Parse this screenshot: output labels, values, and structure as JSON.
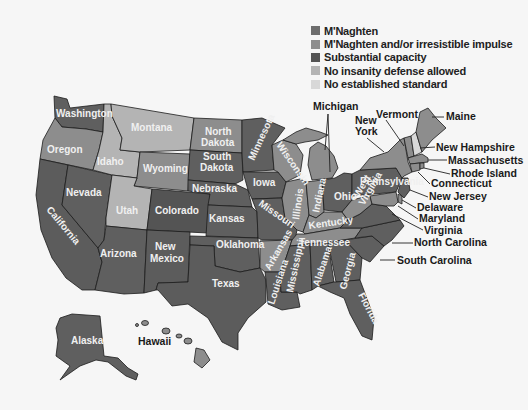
{
  "legend": {
    "items": [
      {
        "label": "M'Naghten",
        "color": "#6d6d6d",
        "key": "mn"
      },
      {
        "label": "M'Naghten and/or irresistible impulse",
        "color": "#8d8d8d",
        "key": "ii"
      },
      {
        "label": "Substantial capacity",
        "color": "#545454",
        "key": "sc"
      },
      {
        "label": "No insanity defense allowed",
        "color": "#b4b4b4",
        "key": "no"
      },
      {
        "label": "No established standard",
        "color": "#d8d8d8",
        "key": "ne"
      }
    ]
  },
  "states": {
    "washington": {
      "label": "Washington",
      "standard": "M'Naghten"
    },
    "oregon": {
      "label": "Oregon",
      "standard": "M'Naghten and/or irresistible impulse"
    },
    "california": {
      "label": "California",
      "standard": "M'Naghten"
    },
    "nevada": {
      "label": "Nevada",
      "standard": "M'Naghten"
    },
    "idaho": {
      "label": "Idaho",
      "standard": "No insanity defense allowed"
    },
    "montana": {
      "label": "Montana",
      "standard": "No insanity defense allowed"
    },
    "wyoming": {
      "label": "Wyoming",
      "standard": "M'Naghten and/or irresistible impulse"
    },
    "utah": {
      "label": "Utah",
      "standard": "No insanity defense allowed"
    },
    "colorado": {
      "label": "Colorado",
      "standard": "Substantial capacity"
    },
    "arizona": {
      "label": "Arizona",
      "standard": "M'Naghten"
    },
    "new_mexico": {
      "label": "New Mexico",
      "standard": "M'Naghten and/or irresistible impulse"
    },
    "north_dakota": {
      "label": "North Dakota",
      "standard": "M'Naghten and/or irresistible impulse"
    },
    "south_dakota": {
      "label": "South Dakota",
      "standard": "M'Naghten"
    },
    "nebraska": {
      "label": "Nebraska",
      "standard": "M'Naghten"
    },
    "kansas": {
      "label": "Kansas",
      "standard": "M'Naghten"
    },
    "oklahoma": {
      "label": "Oklahoma",
      "standard": "M'Naghten"
    },
    "texas": {
      "label": "Texas",
      "standard": "M'Naghten"
    },
    "minnesota": {
      "label": "Minnesota",
      "standard": "M'Naghten"
    },
    "iowa": {
      "label": "Iowa",
      "standard": "M'Naghten"
    },
    "missouri": {
      "label": "Missouri",
      "standard": "M'Naghten"
    },
    "arkansas": {
      "label": "Arkansas",
      "standard": "M'Naghten and/or irresistible impulse"
    },
    "louisiana": {
      "label": "Louisiana",
      "standard": "M'Naghten"
    },
    "wisconsin": {
      "label": "Wisconsin",
      "standard": "M'Naghten and/or irresistible impulse"
    },
    "illinois": {
      "label": "Illinois",
      "standard": "M'Naghten and/or irresistible impulse"
    },
    "michigan": {
      "label": "Michigan",
      "standard": "M'Naghten and/or irresistible impulse"
    },
    "indiana": {
      "label": "Indiana",
      "standard": "M'Naghten and/or irresistible impulse"
    },
    "ohio": {
      "label": "Ohio",
      "standard": "M'Naghten"
    },
    "kentucky": {
      "label": "Kentucky",
      "standard": "M'Naghten and/or irresistible impulse"
    },
    "tennessee": {
      "label": "Tennessee",
      "standard": "M'Naghten and/or irresistible impulse"
    },
    "mississippi": {
      "label": "Mississippi",
      "standard": "M'Naghten"
    },
    "alabama": {
      "label": "Alabama",
      "standard": "M'Naghten"
    },
    "georgia": {
      "label": "Georgia",
      "standard": "M'Naghten"
    },
    "florida": {
      "label": "Florida",
      "standard": "M'Naghten"
    },
    "south_carolina": {
      "label": "South Carolina",
      "standard": "M'Naghten"
    },
    "north_carolina": {
      "label": "North Carolina",
      "standard": "M'Naghten"
    },
    "virginia": {
      "label": "Virginia",
      "standard": "M'Naghten"
    },
    "west_virginia": {
      "label": "West Virginia",
      "standard": "M'Naghten and/or irresistible impulse"
    },
    "pennsylvania": {
      "label": "Pennsylvania",
      "standard": "M'Naghten"
    },
    "new_york": {
      "label": "New York",
      "standard": "M'Naghten and/or irresistible impulse"
    },
    "vermont": {
      "label": "Vermont",
      "standard": "M'Naghten and/or irresistible impulse"
    },
    "new_hampshire": {
      "label": "New Hampshire",
      "standard": "No established standard"
    },
    "maine": {
      "label": "Maine",
      "standard": "M'Naghten and/or irresistible impulse"
    },
    "massachusetts": {
      "label": "Massachusetts",
      "standard": "M'Naghten and/or irresistible impulse"
    },
    "rhode_island": {
      "label": "Rhode Island",
      "standard": "M'Naghten and/or irresistible impulse"
    },
    "connecticut": {
      "label": "Connecticut",
      "standard": "M'Naghten and/or irresistible impulse"
    },
    "new_jersey": {
      "label": "New Jersey",
      "standard": "M'Naghten"
    },
    "delaware": {
      "label": "Delaware",
      "standard": "M'Naghten and/or irresistible impulse"
    },
    "maryland": {
      "label": "Maryland",
      "standard": "M'Naghten and/or irresistible impulse"
    },
    "alaska": {
      "label": "Alaska",
      "standard": "M'Naghten"
    },
    "hawaii": {
      "label": "Hawaii",
      "standard": "M'Naghten and/or irresistible impulse"
    }
  },
  "labels": {
    "new_mexico_1": "New",
    "new_mexico_2": "Mexico",
    "north_dakota_1": "North",
    "north_dakota_2": "Dakota",
    "south_dakota_1": "South",
    "south_dakota_2": "Dakota",
    "new_york_1": "New",
    "new_york_2": "York",
    "west_virginia_1": "West",
    "west_virginia_2": "Virginia"
  }
}
